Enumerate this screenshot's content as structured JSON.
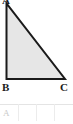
{
  "figure": {
    "type": "right-triangle",
    "fill_color": "#e6e6e6",
    "stroke_color": "#1a1a1a",
    "vertices": {
      "a": {
        "label": "A",
        "x": 6,
        "y": 3
      },
      "b": {
        "label": "B",
        "x": 6,
        "y": 79
      },
      "c": {
        "label": "C",
        "x": 65,
        "y": 79
      }
    }
  },
  "table": {
    "rows": [
      {
        "cells": [
          "A",
          "",
          "",
          ""
        ]
      }
    ],
    "column_count": 4,
    "gridline_color": "#ececec",
    "text_color": "#c9c9c9"
  }
}
